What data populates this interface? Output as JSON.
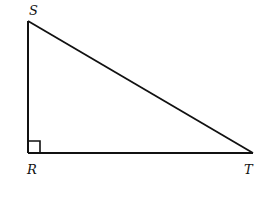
{
  "diagram": {
    "type": "right-triangle",
    "vertices": {
      "S": {
        "label": "S",
        "x": 28,
        "y": 21
      },
      "R": {
        "label": "R",
        "x": 28,
        "y": 153
      },
      "T": {
        "label": "T",
        "x": 253,
        "y": 153
      }
    },
    "right_angle_at": "R",
    "stroke_color": "#111111"
  }
}
